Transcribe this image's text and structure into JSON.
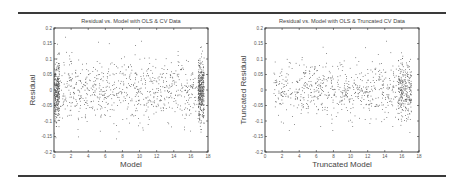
{
  "chart_data": [
    {
      "type": "scatter",
      "title": "Residual vs. Model with OLS & CV Data",
      "xlabel": "Model",
      "ylabel": "Residual",
      "xlim": [
        0,
        18
      ],
      "ylim": [
        -0.2,
        0.2
      ],
      "xticks": [
        "0",
        "2",
        "4",
        "6",
        "8",
        "10",
        "12",
        "14",
        "16",
        "18"
      ],
      "yticks": [
        "-0.2",
        "-0.15",
        "-0.1",
        "-0.05",
        "0",
        "0.05",
        "0.1",
        "0.15",
        "0.2"
      ],
      "grid": false,
      "legend": null,
      "point_color": "#555555",
      "description": "Dense cloud of residuals centered near 0 spanning roughly -0.2 to 0.16; strong vertical clustering near x≈0-0.5 and x≈17-17.5; scattered points between",
      "approx_points": 1400,
      "clusters": [
        {
          "x_range": [
            0.0,
            0.6
          ],
          "y_mean": 0.0,
          "y_sd": 0.05,
          "n": 300
        },
        {
          "x_range": [
            16.8,
            17.5
          ],
          "y_mean": 0.0,
          "y_sd": 0.05,
          "n": 380
        },
        {
          "x_range": [
            0.5,
            16.8
          ],
          "y_mean": 0.0,
          "y_sd": 0.05,
          "n": 720
        }
      ]
    },
    {
      "type": "scatter",
      "title": "Residual vs. Model with OLS & Truncated CV Data",
      "xlabel": "Truncated Model",
      "ylabel": "Truncated Residual",
      "xlim": [
        0,
        18
      ],
      "ylim": [
        -0.2,
        0.2
      ],
      "xticks": [
        "0",
        "2",
        "4",
        "6",
        "8",
        "10",
        "12",
        "14",
        "16",
        "18"
      ],
      "yticks": [
        "-0.2",
        "-0.15",
        "-0.1",
        "-0.05",
        "0",
        "0.05",
        "0.1",
        "0.15",
        "0.2"
      ],
      "grid": false,
      "legend": null,
      "point_color": "#555555",
      "description": "Residuals between roughly -0.18 and 0.17 for x from ~1 to ~17; denser near x≈16-17",
      "approx_points": 900,
      "clusters": [
        {
          "x_range": [
            1.0,
            16.0
          ],
          "y_mean": 0.0,
          "y_sd": 0.045,
          "n": 650
        },
        {
          "x_range": [
            15.5,
            17.1
          ],
          "y_mean": 0.0,
          "y_sd": 0.045,
          "n": 250
        }
      ]
    }
  ]
}
